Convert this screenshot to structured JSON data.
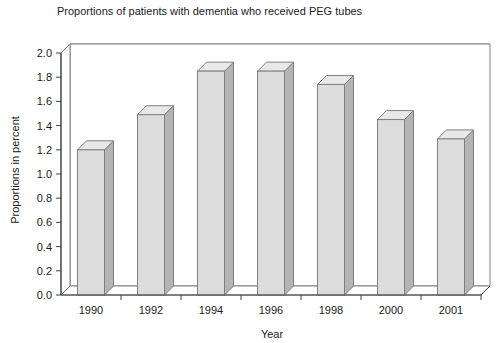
{
  "chart_data": {
    "type": "bar",
    "title": "Proportions of patients with dementia who received PEG tubes",
    "xlabel": "Year",
    "ylabel": "Proportions in percent",
    "categories": [
      "1990",
      "1992",
      "1994",
      "1996",
      "1998",
      "2000",
      "2001"
    ],
    "values": [
      1.2,
      1.49,
      1.85,
      1.85,
      1.74,
      1.45,
      1.29
    ],
    "ylim": [
      0.0,
      2.0
    ],
    "ytick_step": 0.2,
    "yticks": [
      "0.0",
      "0.2",
      "0.4",
      "0.6",
      "0.8",
      "1.0",
      "1.2",
      "1.4",
      "1.6",
      "1.8",
      "2.0"
    ],
    "grid": true,
    "legend": "none",
    "style": "3d-column",
    "colors": {
      "bar_front": "#dcdcdc",
      "bar_side": "#b4b4b4",
      "bar_top": "#e8e8e8",
      "bar_outline": "#808080",
      "grid_line": "#808080",
      "axis_line": "#404040",
      "background": "#ffffff",
      "text": "#1a1a1a"
    }
  }
}
